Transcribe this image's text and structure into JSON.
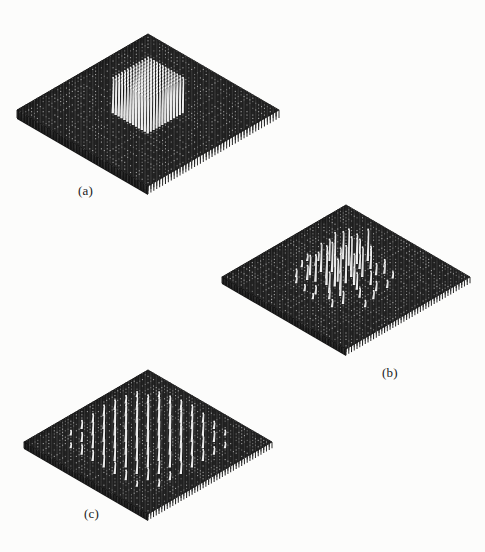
{
  "figure": {
    "background_color": "#fcfcfb",
    "grid_color": "#2b2b2b",
    "grid_dot_color": "#8e8e8e",
    "stem_highlight_color": "#f2f2f2",
    "stem_shadow_color": "#111111"
  },
  "panels": [
    {
      "id": "a",
      "label": "(a)",
      "label_x": 78,
      "label_y": 190,
      "caption_text": "(a)",
      "description": "box-plateau function",
      "center_x": 148,
      "center_y": 110,
      "half_width": 131,
      "half_height": 76,
      "plate_thickness": 9,
      "grid_n": 46,
      "surface_pattern": "plateau",
      "plateau": {
        "i_min": 17,
        "i_max": 29,
        "j_min": 17,
        "j_max": 29,
        "height": 34
      }
    },
    {
      "id": "b",
      "label": "(b)",
      "label_x": 382,
      "label_y": 372,
      "caption_text": "(b)",
      "description": "randomly scattered spikes",
      "center_x": 346,
      "center_y": 277,
      "half_width": 124,
      "half_height": 72,
      "plate_thickness": 7,
      "grid_n": 46,
      "surface_pattern": "random-spikes"
    },
    {
      "id": "c",
      "label": "(c)",
      "label_x": 84,
      "label_y": 513,
      "caption_text": "(c)",
      "description": "periodic lattice of spikes",
      "center_x": 148,
      "center_y": 442,
      "half_width": 124,
      "half_height": 72,
      "plate_thickness": 7,
      "grid_n": 46,
      "surface_pattern": "periodic-spikes"
    }
  ],
  "chart_data": {
    "type": "scatter",
    "xlabel": "",
    "ylabel": "",
    "subplots": [
      {
        "id": "a",
        "label": "(a)",
        "kind": "plateau",
        "grid": [
          46,
          46
        ],
        "baseline_height": 0,
        "plateau_region_x": [
          17,
          29
        ],
        "plateau_region_y": [
          17,
          29
        ],
        "plateau_height": 34,
        "notes": "uniform rectangular block of tall stems at center, flat elsewhere"
      },
      {
        "id": "b",
        "label": "(b)",
        "kind": "random-spikes",
        "grid": [
          46,
          46
        ],
        "n_spikes": 54,
        "height_range": [
          4,
          38
        ],
        "notes": "irregular scatter of needle spikes concentrated near the center",
        "spikes": [
          {
            "i": 18,
            "j": 14,
            "h": 22
          },
          {
            "i": 21,
            "j": 13,
            "h": 30
          },
          {
            "i": 24,
            "j": 15,
            "h": 18
          },
          {
            "i": 16,
            "j": 17,
            "h": 26
          },
          {
            "i": 19,
            "j": 18,
            "h": 35
          },
          {
            "i": 22,
            "j": 17,
            "h": 14
          },
          {
            "i": 25,
            "j": 19,
            "h": 28
          },
          {
            "i": 27,
            "j": 16,
            "h": 10
          },
          {
            "i": 14,
            "j": 20,
            "h": 20
          },
          {
            "i": 17,
            "j": 21,
            "h": 33
          },
          {
            "i": 20,
            "j": 22,
            "h": 24
          },
          {
            "i": 23,
            "j": 21,
            "h": 38
          },
          {
            "i": 26,
            "j": 23,
            "h": 16
          },
          {
            "i": 29,
            "j": 20,
            "h": 12
          },
          {
            "i": 13,
            "j": 24,
            "h": 9
          },
          {
            "i": 16,
            "j": 25,
            "h": 27
          },
          {
            "i": 19,
            "j": 26,
            "h": 31
          },
          {
            "i": 22,
            "j": 25,
            "h": 21
          },
          {
            "i": 25,
            "j": 27,
            "h": 34
          },
          {
            "i": 28,
            "j": 24,
            "h": 15
          },
          {
            "i": 31,
            "j": 26,
            "h": 8
          },
          {
            "i": 15,
            "j": 28,
            "h": 18
          },
          {
            "i": 18,
            "j": 29,
            "h": 25
          },
          {
            "i": 21,
            "j": 28,
            "h": 29
          },
          {
            "i": 24,
            "j": 30,
            "h": 19
          },
          {
            "i": 27,
            "j": 29,
            "h": 23
          },
          {
            "i": 30,
            "j": 31,
            "h": 11
          },
          {
            "i": 12,
            "j": 22,
            "h": 7
          },
          {
            "i": 33,
            "j": 18,
            "h": 6
          },
          {
            "i": 11,
            "j": 27,
            "h": 5
          },
          {
            "i": 34,
            "j": 24,
            "h": 7
          },
          {
            "i": 20,
            "j": 11,
            "h": 8
          },
          {
            "i": 26,
            "j": 12,
            "h": 6
          },
          {
            "i": 15,
            "j": 33,
            "h": 5
          },
          {
            "i": 29,
            "j": 34,
            "h": 6
          },
          {
            "i": 23,
            "j": 35,
            "h": 4
          },
          {
            "i": 17,
            "j": 12,
            "h": 12
          },
          {
            "i": 28,
            "j": 14,
            "h": 9
          },
          {
            "i": 12,
            "j": 18,
            "h": 6
          },
          {
            "i": 32,
            "j": 21,
            "h": 8
          },
          {
            "i": 10,
            "j": 24,
            "h": 5
          },
          {
            "i": 35,
            "j": 28,
            "h": 5
          },
          {
            "i": 13,
            "j": 31,
            "h": 6
          },
          {
            "i": 31,
            "j": 14,
            "h": 5
          },
          {
            "i": 22,
            "j": 33,
            "h": 7
          },
          {
            "i": 19,
            "j": 34,
            "h": 5
          },
          {
            "i": 26,
            "j": 32,
            "h": 9
          },
          {
            "i": 16,
            "j": 30,
            "h": 13
          },
          {
            "i": 24,
            "j": 24,
            "h": 36
          },
          {
            "i": 21,
            "j": 19,
            "h": 32
          },
          {
            "i": 23,
            "j": 27,
            "h": 30
          },
          {
            "i": 18,
            "j": 23,
            "h": 28
          },
          {
            "i": 25,
            "j": 22,
            "h": 26
          },
          {
            "i": 20,
            "j": 16,
            "h": 24
          }
        ]
      },
      {
        "id": "c",
        "label": "(c)",
        "kind": "periodic-spikes",
        "grid": [
          46,
          46
        ],
        "period_x": 4,
        "period_y": 4,
        "height_range": [
          4,
          36
        ],
        "notes": "regular lattice of needle spikes with envelope tapering outward"
      }
    ]
  }
}
